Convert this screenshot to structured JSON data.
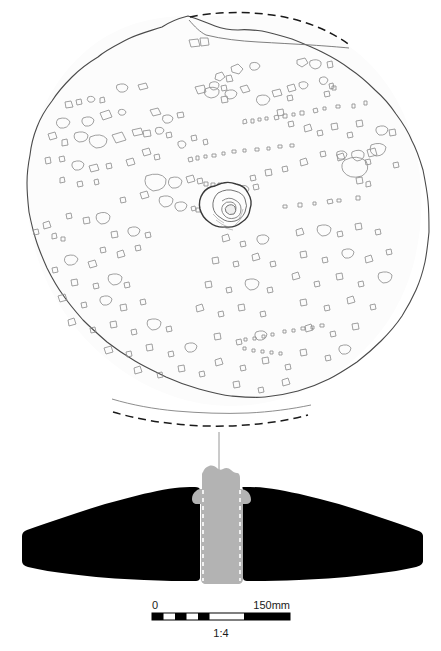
{
  "figure": {
    "kind": "archaeological-object-drawing",
    "views": [
      {
        "id": "plan-view",
        "label": "plan view",
        "description": "Circular stone disc seen from above, surface covered with outlined rock inclusions; irregular central perforation; broken edge at top and bottom reconstructed with dashed arcs."
      },
      {
        "id": "section-view",
        "label": "cross-section",
        "description": "Solid black filled profile section, wide wedge tapering to both sides, with a grey central plug bounded by white dashed lines marking the perforation."
      }
    ],
    "linework": {
      "outline_color": "#4a4a4a",
      "inclusion_color": "#8c8c8c",
      "section_fill": "#000000",
      "plug_fill": "#b3b3b3",
      "plug_dash_color": "#ffffff",
      "background": "#ffffff"
    },
    "tie_line": {
      "name": "alignment-line",
      "description": "thin vertical line linking plan view centre to section view"
    }
  },
  "scale_bar": {
    "start_label": "0",
    "end_label": "150mm",
    "ratio_label": "1:4",
    "unit": "mm",
    "total_length_mm": 150,
    "bar_color": "#000000",
    "bar_outline_color": "#000000",
    "segments": [
      {
        "from_mm": 0,
        "to_mm": 12.5,
        "filled": true
      },
      {
        "from_mm": 12.5,
        "to_mm": 25,
        "filled": false
      },
      {
        "from_mm": 25,
        "to_mm": 37.5,
        "filled": true
      },
      {
        "from_mm": 37.5,
        "to_mm": 50,
        "filled": false
      },
      {
        "from_mm": 50,
        "to_mm": 62.5,
        "filled": true
      },
      {
        "from_mm": 62.5,
        "to_mm": 100,
        "filled": false
      },
      {
        "from_mm": 100,
        "to_mm": 150,
        "filled": true
      }
    ]
  }
}
